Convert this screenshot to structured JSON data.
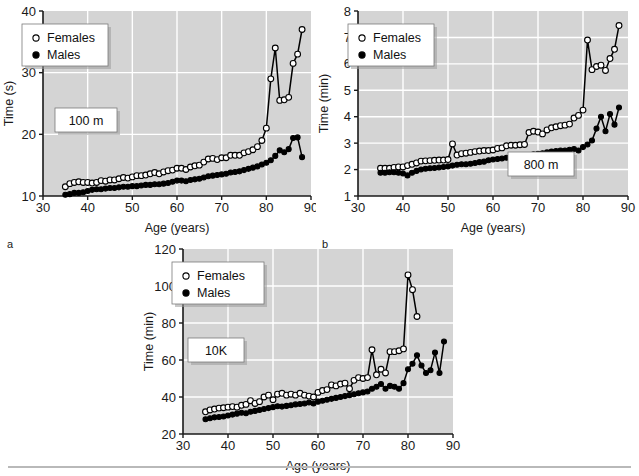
{
  "figure": {
    "background_color": "#ffffff",
    "plot_background_color": "#d4d4d4",
    "gridline_color": "#ffffff",
    "axis_color": "#1a1a1a",
    "series_line_color": "#000000",
    "female_marker_fill": "#ffffff",
    "male_marker_fill": "#000000"
  },
  "panels": [
    {
      "letter": "a",
      "label_box": "100 m",
      "legend": {
        "female_label": "Females",
        "male_label": "Males"
      }
    },
    {
      "letter": "b",
      "label_box": "800 m",
      "legend": {
        "female_label": "Females",
        "male_label": "Males"
      }
    },
    {
      "letter": "c",
      "label_box": "10K",
      "legend": {
        "female_label": "Females",
        "male_label": "Males"
      }
    }
  ],
  "chart_data": [
    {
      "type": "line",
      "panel": "a",
      "title": "100 m",
      "xlabel": "Age (years)",
      "ylabel": "Time (s)",
      "xlim": [
        30,
        90
      ],
      "ylim": [
        10,
        40
      ],
      "xticks": [
        30,
        40,
        50,
        60,
        70,
        80,
        90
      ],
      "yticks": [
        10,
        20,
        30,
        40
      ],
      "grid": true,
      "legend_position": "upper-left",
      "x": [
        35,
        36,
        37,
        38,
        39,
        40,
        41,
        42,
        43,
        44,
        45,
        46,
        47,
        48,
        49,
        50,
        51,
        52,
        53,
        54,
        55,
        56,
        57,
        58,
        59,
        60,
        61,
        62,
        63,
        64,
        65,
        66,
        67,
        68,
        69,
        70,
        71,
        72,
        73,
        74,
        75,
        76,
        77,
        78,
        79,
        80,
        81,
        82,
        83,
        84,
        85,
        86,
        87,
        88
      ],
      "series": [
        {
          "name": "Females",
          "marker": "open-circle",
          "values": [
            11.5,
            12.0,
            12.2,
            12.3,
            12.2,
            12.2,
            12.1,
            12.2,
            12.5,
            12.4,
            12.6,
            12.6,
            12.8,
            13.0,
            12.9,
            13.1,
            13.3,
            13.3,
            13.4,
            13.6,
            13.8,
            13.6,
            13.9,
            14.1,
            14.2,
            14.5,
            14.5,
            14.3,
            14.7,
            14.9,
            15.0,
            15.5,
            16.0,
            16.1,
            15.9,
            16.2,
            16.2,
            16.6,
            16.6,
            16.6,
            17.0,
            17.2,
            17.5,
            18.0,
            19.0,
            21.0,
            29.0,
            34.0,
            25.5,
            25.6,
            26.0,
            31.5,
            33.0,
            37.0
          ]
        },
        {
          "name": "Males",
          "marker": "filled-circle",
          "values": [
            10.2,
            10.3,
            10.5,
            10.5,
            10.6,
            10.8,
            11.0,
            11.1,
            11.1,
            11.2,
            11.3,
            11.3,
            11.4,
            11.5,
            11.5,
            11.6,
            11.6,
            11.7,
            11.8,
            11.8,
            11.9,
            11.9,
            12.0,
            12.1,
            12.3,
            12.5,
            12.5,
            12.4,
            12.6,
            12.7,
            12.8,
            13.0,
            13.2,
            13.3,
            13.4,
            13.5,
            13.6,
            13.8,
            13.9,
            14.0,
            14.2,
            14.4,
            14.6,
            14.8,
            15.1,
            15.4,
            15.8,
            16.5,
            17.4,
            17.1,
            17.6,
            19.4,
            19.5,
            16.3
          ]
        }
      ]
    },
    {
      "type": "line",
      "panel": "b",
      "title": "800 m",
      "xlabel": "Age (years)",
      "ylabel": "Time (min)",
      "xlim": [
        30,
        90
      ],
      "ylim": [
        1,
        8
      ],
      "xticks": [
        30,
        40,
        50,
        60,
        70,
        80,
        90
      ],
      "yticks": [
        1,
        2,
        3,
        4,
        5,
        6,
        7,
        8
      ],
      "grid": true,
      "legend_position": "upper-left",
      "x": [
        35,
        36,
        37,
        38,
        39,
        40,
        41,
        42,
        43,
        44,
        45,
        46,
        47,
        48,
        49,
        50,
        51,
        52,
        53,
        54,
        55,
        56,
        57,
        58,
        59,
        60,
        61,
        62,
        63,
        64,
        65,
        66,
        67,
        68,
        69,
        70,
        71,
        72,
        73,
        74,
        75,
        76,
        77,
        78,
        79,
        80,
        81,
        82,
        83,
        84,
        85,
        86,
        87,
        88
      ],
      "series": [
        {
          "name": "Females",
          "marker": "open-circle",
          "values": [
            2.05,
            2.05,
            2.05,
            2.08,
            2.1,
            2.1,
            2.15,
            2.2,
            2.25,
            2.32,
            2.33,
            2.34,
            2.35,
            2.36,
            2.36,
            2.38,
            2.97,
            2.55,
            2.6,
            2.62,
            2.65,
            2.68,
            2.7,
            2.72,
            2.72,
            2.74,
            2.8,
            2.82,
            2.9,
            2.92,
            2.92,
            2.94,
            2.95,
            3.4,
            3.45,
            3.42,
            3.35,
            3.5,
            3.58,
            3.62,
            3.66,
            3.68,
            3.72,
            3.95,
            4.05,
            4.25,
            6.9,
            5.78,
            5.9,
            5.95,
            5.75,
            6.2,
            6.55,
            7.45
          ]
        },
        {
          "name": "Males",
          "marker": "filled-circle",
          "values": [
            1.88,
            1.88,
            1.9,
            1.9,
            1.88,
            1.85,
            1.78,
            1.88,
            1.95,
            2.0,
            2.03,
            2.05,
            2.06,
            2.08,
            2.1,
            2.12,
            2.15,
            2.18,
            2.2,
            2.2,
            2.22,
            2.25,
            2.28,
            2.3,
            2.35,
            2.38,
            2.4,
            2.42,
            2.45,
            2.46,
            2.48,
            2.5,
            2.52,
            2.55,
            2.58,
            2.6,
            2.62,
            2.65,
            2.68,
            2.7,
            2.72,
            2.72,
            2.75,
            2.78,
            2.72,
            2.85,
            2.95,
            3.1,
            3.55,
            4.0,
            3.45,
            4.1,
            3.7,
            4.35
          ]
        }
      ]
    },
    {
      "type": "line",
      "panel": "c",
      "title": "10K",
      "xlabel": "Age (years)",
      "ylabel": "Time (min)",
      "xlim": [
        30,
        90
      ],
      "ylim": [
        20,
        120
      ],
      "xticks": [
        30,
        40,
        50,
        60,
        70,
        80,
        90
      ],
      "yticks": [
        20,
        40,
        60,
        80,
        100,
        120
      ],
      "grid": true,
      "legend_position": "upper-left",
      "x": [
        35,
        36,
        37,
        38,
        39,
        40,
        41,
        42,
        43,
        44,
        45,
        46,
        47,
        48,
        49,
        50,
        51,
        52,
        53,
        54,
        55,
        56,
        57,
        58,
        59,
        60,
        61,
        62,
        63,
        64,
        65,
        66,
        67,
        68,
        69,
        70,
        71,
        72,
        73,
        74,
        75,
        76,
        77,
        78,
        79,
        80,
        81,
        82,
        83,
        84,
        85,
        86,
        87,
        88
      ],
      "series": [
        {
          "name": "Females",
          "marker": "open-circle",
          "values": [
            32.0,
            33.0,
            33.5,
            34.0,
            34.2,
            34.5,
            34.8,
            34.5,
            35.5,
            36.0,
            38.0,
            36.5,
            37.5,
            40.0,
            41.0,
            38.5,
            41.5,
            42.0,
            41.0,
            41.5,
            41.0,
            42.0,
            41.0,
            40.5,
            40.0,
            42.5,
            43.5,
            44.0,
            46.5,
            46.0,
            47.0,
            47.5,
            44.5,
            49.0,
            50.5,
            50.0,
            50.5,
            65.5,
            52.0,
            55.0,
            53.0,
            64.5,
            64.5,
            65.0,
            66.0,
            106.0,
            98.0,
            83.5,
            null,
            null,
            null,
            null,
            null,
            null
          ]
        },
        {
          "name": "Males",
          "marker": "filled-circle",
          "values": [
            28.0,
            28.5,
            29.0,
            29.2,
            29.5,
            30.0,
            30.5,
            31.0,
            31.5,
            31.2,
            32.0,
            32.5,
            33.0,
            33.5,
            34.0,
            34.5,
            35.0,
            34.8,
            35.2,
            35.5,
            36.0,
            36.2,
            36.5,
            37.0,
            36.5,
            37.5,
            38.0,
            38.5,
            39.0,
            39.5,
            40.0,
            40.5,
            41.0,
            41.5,
            42.0,
            42.5,
            43.0,
            44.5,
            45.5,
            47.0,
            44.5,
            46.0,
            45.5,
            44.5,
            47.5,
            55.0,
            58.0,
            62.5,
            57.0,
            53.0,
            54.5,
            64.0,
            53.0,
            70.0
          ]
        }
      ]
    }
  ]
}
